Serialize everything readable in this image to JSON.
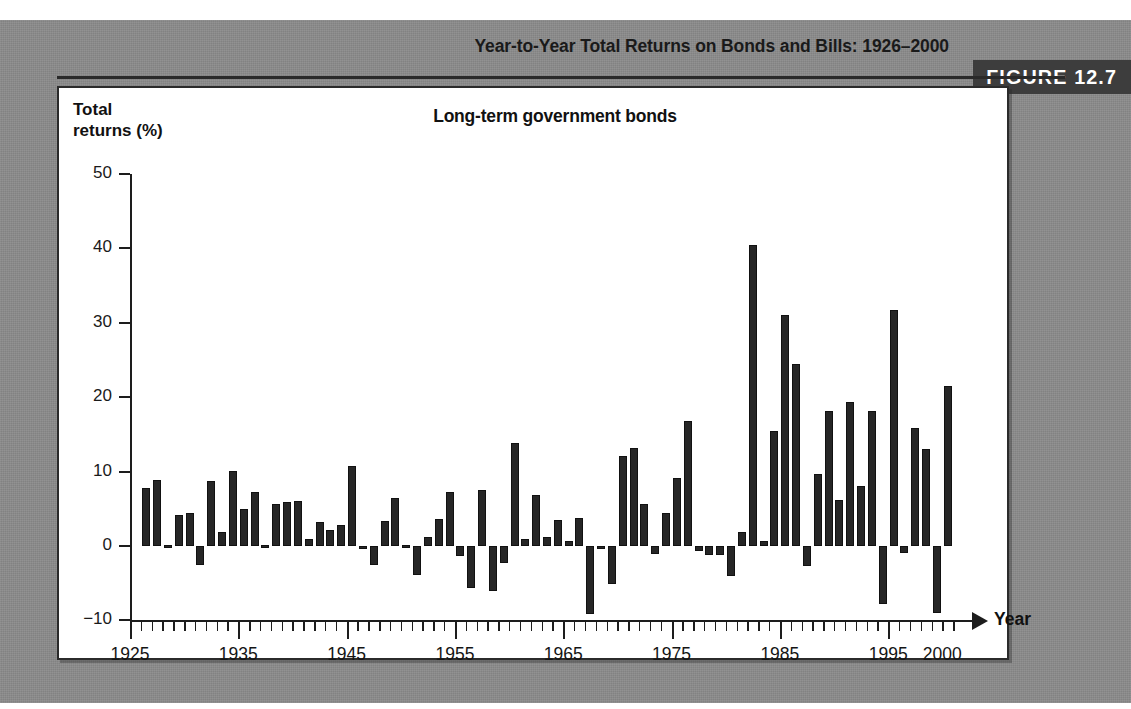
{
  "figure": {
    "title": "Year-to-Year Total Returns on Bonds and Bills: 1926–2000",
    "badge_label": "FIGURE 12.7",
    "badge_color": "#3d3d3d",
    "page_background": "#8b8b8b",
    "panel_background": "#ffffff"
  },
  "chart_data": {
    "type": "bar",
    "title": "Long-term government bonds",
    "subtitle": "",
    "xlabel": "Year",
    "ylabel": "Total\nreturns (%)",
    "ylabel_lines": [
      "Total",
      "returns (%)"
    ],
    "ylim": [
      -10,
      50
    ],
    "xlim": [
      1925,
      2002
    ],
    "grid": false,
    "legend": "none",
    "bar_color": "#262626",
    "zero_line": 0,
    "y_ticks": [
      50,
      40,
      30,
      20,
      10,
      0,
      -10
    ],
    "y_tick_labels": [
      "50",
      "40",
      "30",
      "20",
      "10",
      "0",
      "−10"
    ],
    "x_ticks": [
      1925,
      1935,
      1945,
      1955,
      1965,
      1975,
      1985,
      1995,
      2000
    ],
    "x_tick_labels": [
      "1925",
      "1935",
      "1945",
      "1955",
      "1965",
      "1975",
      "1985",
      "1995",
      "2000"
    ],
    "x_minor_tick_step": 1,
    "categories": [
      1926,
      1927,
      1928,
      1929,
      1930,
      1931,
      1932,
      1933,
      1934,
      1935,
      1936,
      1937,
      1938,
      1939,
      1940,
      1941,
      1942,
      1943,
      1944,
      1945,
      1946,
      1947,
      1948,
      1949,
      1950,
      1951,
      1952,
      1953,
      1954,
      1955,
      1956,
      1957,
      1958,
      1959,
      1960,
      1961,
      1962,
      1963,
      1964,
      1965,
      1966,
      1967,
      1968,
      1969,
      1970,
      1971,
      1972,
      1973,
      1974,
      1975,
      1976,
      1977,
      1978,
      1979,
      1980,
      1981,
      1982,
      1983,
      1984,
      1985,
      1986,
      1987,
      1988,
      1989,
      1990,
      1991,
      1992,
      1993,
      1994,
      1995,
      1996,
      1997,
      1998,
      1999,
      2000
    ],
    "values": [
      7.8,
      8.9,
      0.1,
      4.2,
      4.5,
      -2.6,
      8.8,
      1.9,
      10.1,
      5.0,
      7.3,
      0.2,
      5.6,
      5.9,
      6.1,
      0.9,
      3.2,
      2.1,
      2.8,
      10.7,
      -0.1,
      -2.6,
      3.4,
      6.5,
      0.1,
      -3.9,
      1.2,
      3.6,
      7.2,
      -1.3,
      -5.6,
      7.5,
      -6.1,
      -2.3,
      13.8,
      1.0,
      6.9,
      1.2,
      3.5,
      0.7,
      3.7,
      -9.2,
      -0.3,
      -5.1,
      12.1,
      13.2,
      5.7,
      -1.1,
      4.4,
      9.2,
      16.8,
      -0.7,
      -1.2,
      -1.2,
      -4.0,
      1.9,
      40.4,
      0.7,
      15.5,
      31.0,
      24.5,
      -2.7,
      9.7,
      18.1,
      6.2,
      19.3,
      8.1,
      18.2,
      -7.8,
      31.7,
      -0.9,
      15.9,
      13.1,
      -9.0,
      21.5
    ]
  }
}
